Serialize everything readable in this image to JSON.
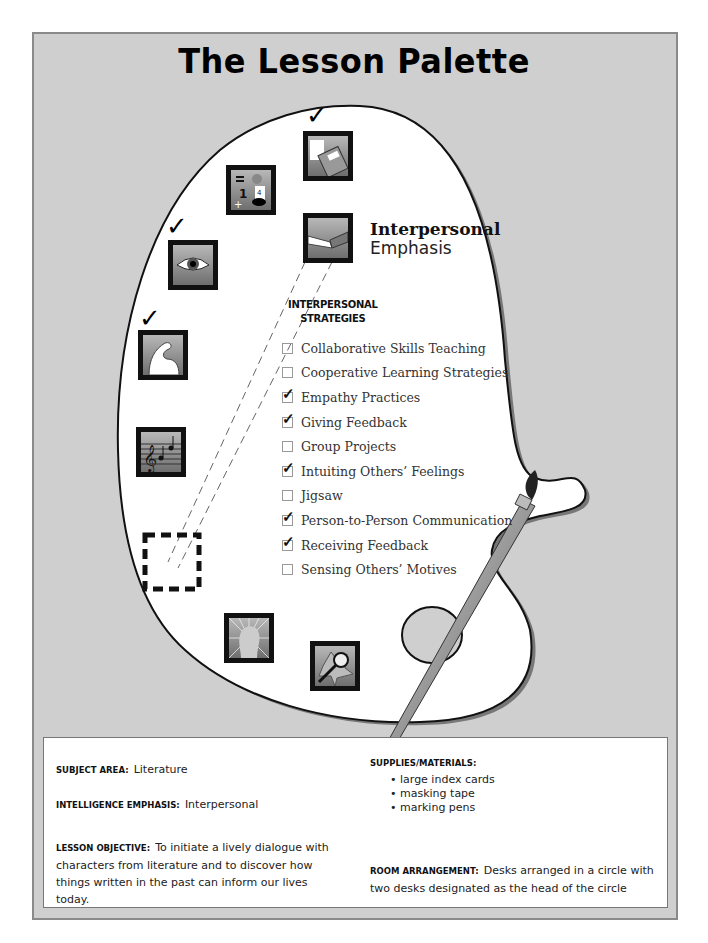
{
  "title": "The Lesson Palette",
  "emphasis": {
    "title": "Interpersonal",
    "subtitle": "Emphasis"
  },
  "strategies": {
    "heading_line1": "INTERPERSONAL",
    "heading_line2": "STRATEGIES",
    "items": [
      {
        "label": "Collaborative Skills Teaching",
        "checked": false
      },
      {
        "label": "Cooperative Learning Strategies",
        "checked": false
      },
      {
        "label": "Empathy Practices",
        "checked": true
      },
      {
        "label": "Giving Feedback",
        "checked": true
      },
      {
        "label": "Group Projects",
        "checked": false
      },
      {
        "label": "Intuiting Others’ Feelings",
        "checked": true
      },
      {
        "label": "Jigsaw",
        "checked": false
      },
      {
        "label": "Person-to-Person Communication",
        "checked": true
      },
      {
        "label": "Receiving Feedback",
        "checked": true
      },
      {
        "label": "Sensing Others’ Motives",
        "checked": false
      }
    ]
  },
  "intelligence_icons": [
    {
      "name": "verbal-linguistic-book-icon",
      "checked": true
    },
    {
      "name": "logical-mathematical-icon",
      "checked": false
    },
    {
      "name": "interpersonal-handshake-icon",
      "checked": false,
      "selected": true
    },
    {
      "name": "visual-spatial-eye-icon",
      "checked": true
    },
    {
      "name": "bodily-kinesthetic-arm-icon",
      "checked": true
    },
    {
      "name": "musical-notes-icon",
      "checked": false
    },
    {
      "name": "empty-placeholder-slot",
      "checked": false
    },
    {
      "name": "intrapersonal-head-icon",
      "checked": false
    },
    {
      "name": "naturalist-leaf-magnifier-icon",
      "checked": false
    }
  ],
  "check_glyph": "✓",
  "info": {
    "subject_area_label": "SUBJECT AREA:",
    "subject_area": "Literature",
    "intelligence_emphasis_label": "INTELLIGENCE EMPHASIS:",
    "intelligence_emphasis": "Interpersonal",
    "lesson_objective_label": "LESSON OBJECTIVE:",
    "lesson_objective": "To initiate a lively dialogue with characters from literature and to discover how things written in the past can inform our lives today.",
    "supplies_label": "SUPPLIES/MATERIALS:",
    "supplies": [
      "large index cards",
      "masking tape",
      "marking pens"
    ],
    "room_arrangement_label": "ROOM ARRANGEMENT:",
    "room_arrangement": "Desks arranged in a circle with two desks designated as the head of the circle"
  },
  "colors": {
    "frame_bg": "#cfcfcf",
    "palette_bg": "#ffffff",
    "icon_dark": "#111111"
  }
}
